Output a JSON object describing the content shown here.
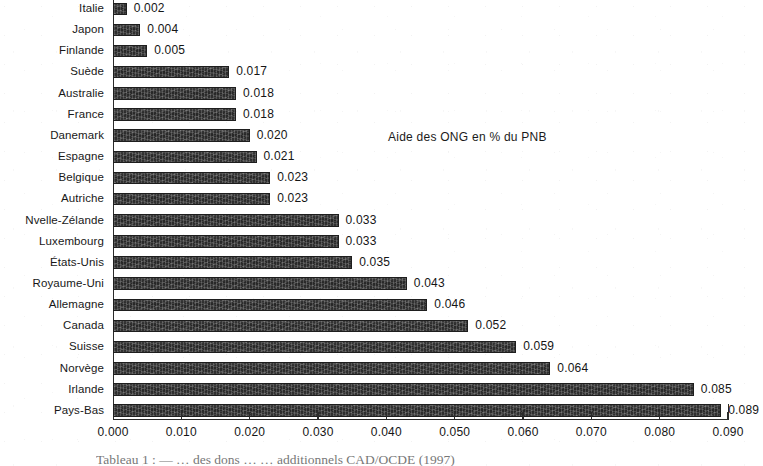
{
  "chart_data": {
    "type": "bar",
    "orientation": "horizontal",
    "title": "",
    "annotation": "Aide des ONG en % du PNB",
    "xlabel": "",
    "ylabel": "",
    "xlim": [
      0.0,
      0.0902
    ],
    "xticks": [
      "0.000",
      "0.010",
      "0.020",
      "0.030",
      "0.040",
      "0.050",
      "0.060",
      "0.070",
      "0.080",
      "0.090"
    ],
    "xtick_values": [
      0.0,
      0.01,
      0.02,
      0.03,
      0.04,
      0.05,
      0.06,
      0.07,
      0.08,
      0.09
    ],
    "grid": false,
    "legend": false,
    "bar_color": "#2e2e2e",
    "categories": [
      "Italie",
      "Japon",
      "Finlande",
      "Suède",
      "Australie",
      "France",
      "Danemark",
      "Espagne",
      "Belgique",
      "Autriche",
      "Nvelle-Zélande",
      "Luxembourg",
      "États-Unis",
      "Royaume-Uni",
      "Allemagne",
      "Canada",
      "Suisse",
      "Norvège",
      "Irlande",
      "Pays-Bas"
    ],
    "values": [
      0.002,
      0.004,
      0.005,
      0.017,
      0.018,
      0.018,
      0.02,
      0.021,
      0.023,
      0.023,
      0.033,
      0.033,
      0.035,
      0.043,
      0.046,
      0.052,
      0.059,
      0.064,
      0.085,
      0.089
    ],
    "value_labels": [
      "0.002",
      "0.004",
      "0.005",
      "0.017",
      "0.018",
      "0.018",
      "0.020",
      "0.021",
      "0.023",
      "0.023",
      "0.033",
      "0.033",
      "0.035",
      "0.043",
      "0.046",
      "0.052",
      "0.059",
      "0.064",
      "0.085",
      "0.089"
    ]
  },
  "caption": {
    "text": "Tableau 1 : — … des dons … … additionnels CAD/OCDE (1997)"
  }
}
